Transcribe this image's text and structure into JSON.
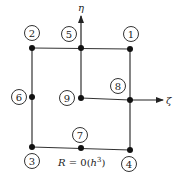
{
  "diagram": {
    "type": "finite-element-node-layout",
    "axes": {
      "vertical": {
        "label": "η"
      },
      "horizontal": {
        "label": "ζ"
      }
    },
    "nodes": [
      {
        "id": "1",
        "label": "1"
      },
      {
        "id": "2",
        "label": "2"
      },
      {
        "id": "3",
        "label": "3"
      },
      {
        "id": "4",
        "label": "4"
      },
      {
        "id": "5",
        "label": "5"
      },
      {
        "id": "6",
        "label": "6"
      },
      {
        "id": "7",
        "label": "7"
      },
      {
        "id": "8",
        "label": "8"
      },
      {
        "id": "9",
        "label": "9"
      }
    ],
    "formula": "R = 0(h³)",
    "formula_parts": {
      "lhs": "R",
      "eq": " = 0(",
      "var": "h",
      "exp": "3",
      "close": ")"
    }
  }
}
